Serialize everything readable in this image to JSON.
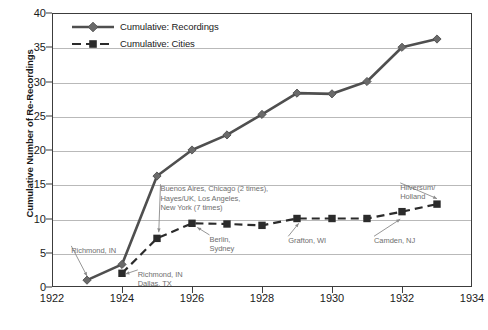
{
  "chart_data": {
    "type": "line",
    "title": "",
    "subtitle": "",
    "xlabel": "",
    "ylabel": "Cumulative Number of Re-Recordings",
    "x": [
      1923,
      1924,
      1925,
      1926,
      1927,
      1928,
      1929,
      1930,
      1931,
      1932,
      1933
    ],
    "xlim": [
      1922,
      1934
    ],
    "ylim": [
      0,
      40
    ],
    "xticks": [
      1922,
      1924,
      1926,
      1928,
      1930,
      1932,
      1934
    ],
    "yticks": [
      0,
      5,
      10,
      15,
      20,
      25,
      30,
      35,
      40
    ],
    "grid": "horizontal",
    "legend_position": "top-left",
    "series": [
      {
        "name": "Cumulative: Recordings",
        "marker": "diamond",
        "linestyle": "solid",
        "color": "#4f4f4f",
        "x": [
          1923,
          1924,
          1925,
          1926,
          1927,
          1928,
          1929,
          1930,
          1931,
          1932,
          1933
        ],
        "values": [
          1,
          3.3,
          16.2,
          20,
          22.2,
          25.2,
          28.3,
          28.2,
          30,
          35,
          36.2
        ]
      },
      {
        "name": "Cumulative: Cities",
        "marker": "square",
        "linestyle": "dashed",
        "color": "#2b2b2b",
        "x": [
          1924,
          1925,
          1926,
          1927,
          1928,
          1929,
          1930,
          1931,
          1932,
          1933
        ],
        "values": [
          2,
          7.1,
          9.3,
          9.2,
          9,
          10,
          10,
          10,
          11,
          12.1
        ]
      }
    ],
    "annotations": [
      {
        "text": "Richmond, IN",
        "label_x": 1922.55,
        "label_y": 6.0,
        "point_x": 1923,
        "point_y": 1.6
      },
      {
        "text": "Richmond, IN\nDallas, TX",
        "label_x": 1924.45,
        "label_y": 2.5,
        "point_x": 1924.1,
        "point_y": 1.9
      },
      {
        "text": "Buenos Aires, Chicago (2 times),\nHayes/UK, Los Angeles,\nNew York (7 times)",
        "label_x": 1925.1,
        "label_y": 15.0,
        "point_x": 1925.05,
        "point_y": 8.0
      },
      {
        "text": "Berlin,\nSydney",
        "label_x": 1926.5,
        "label_y": 7.6,
        "point_x": 1926.15,
        "point_y": 8.7
      },
      {
        "text": "Grafton, WI",
        "label_x": 1928.75,
        "label_y": 7.4,
        "point_x": 1929.05,
        "point_y": 9.3
      },
      {
        "text": "Camden, NJ",
        "label_x": 1931.2,
        "label_y": 7.4,
        "point_x": 1931.95,
        "point_y": 9.9
      },
      {
        "text": "Hilversum/\nHolland",
        "label_x": 1931.95,
        "label_y": 15.2,
        "point_x": 1933.0,
        "point_y": 12.9
      }
    ]
  }
}
